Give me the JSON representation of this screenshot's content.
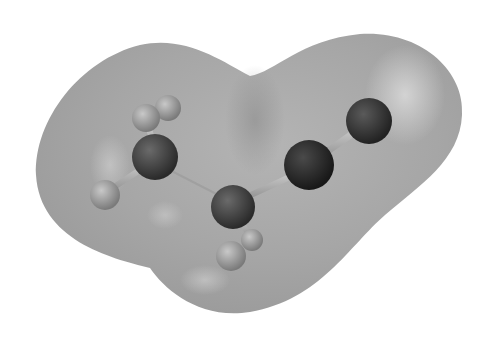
{
  "figure": {
    "molecule": "propanenitrile (CH3-CH2-C≡N)",
    "background_color": "#ffffff",
    "surface_color": "#a8a8a8",
    "atoms": [
      {
        "id": "H1",
        "element": "H",
        "color": "#9a9a9a"
      },
      {
        "id": "H2",
        "element": "H",
        "color": "#a4a4a4"
      },
      {
        "id": "C1",
        "element": "C",
        "color": "#4a4a4a"
      },
      {
        "id": "H3",
        "element": "H",
        "color": "#8e8e8e"
      },
      {
        "id": "C2",
        "element": "C",
        "color": "#505050"
      },
      {
        "id": "H4",
        "element": "H",
        "color": "#9c9c9c"
      },
      {
        "id": "H5",
        "element": "H",
        "color": "#959595"
      },
      {
        "id": "C3",
        "element": "C",
        "color": "#2e2e2e"
      },
      {
        "id": "N",
        "element": "N",
        "color": "#3a3a3a"
      }
    ],
    "bonds": [
      [
        "C1",
        "H1"
      ],
      [
        "C1",
        "H2"
      ],
      [
        "C1",
        "H3"
      ],
      [
        "C1",
        "C2"
      ],
      [
        "C2",
        "H4"
      ],
      [
        "C2",
        "H5"
      ],
      [
        "C2",
        "C3"
      ],
      [
        "C3",
        "N"
      ]
    ]
  }
}
